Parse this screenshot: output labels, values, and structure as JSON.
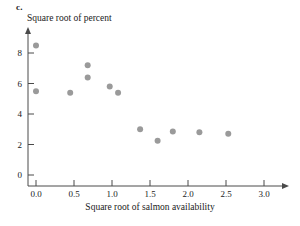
{
  "panel": {
    "label": "c."
  },
  "chart_data": {
    "type": "scatter",
    "title": "",
    "xlabel": "Square root of salmon availability",
    "ylabel": "Square root of percent",
    "xlim": [
      -0.15,
      3.2
    ],
    "ylim": [
      -0.3,
      9.2
    ],
    "grid": false,
    "legend": null,
    "xticks": [
      "0.0",
      "0.5",
      "1.0",
      "1.5",
      "2.0",
      "2.5",
      "3.0"
    ],
    "xtick_values": [
      0.0,
      0.5,
      1.0,
      1.5,
      2.0,
      2.5,
      3.0
    ],
    "yticks": [
      "0",
      "2",
      "4",
      "6",
      "8"
    ],
    "ytick_values": [
      0,
      2,
      4,
      6,
      8
    ],
    "marker": {
      "shape": "circle",
      "color": "#9a9a9a",
      "size": 3
    },
    "points": [
      {
        "x": 0.0,
        "y": 8.5
      },
      {
        "x": 0.0,
        "y": 5.5
      },
      {
        "x": 0.45,
        "y": 5.4
      },
      {
        "x": 0.68,
        "y": 7.2
      },
      {
        "x": 0.68,
        "y": 6.4
      },
      {
        "x": 0.97,
        "y": 5.8
      },
      {
        "x": 1.08,
        "y": 5.4
      },
      {
        "x": 1.37,
        "y": 3.0
      },
      {
        "x": 1.6,
        "y": 2.25
      },
      {
        "x": 1.8,
        "y": 2.85
      },
      {
        "x": 2.15,
        "y": 2.8
      },
      {
        "x": 2.53,
        "y": 2.7
      }
    ]
  }
}
